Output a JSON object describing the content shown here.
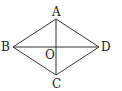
{
  "diagram": {
    "type": "rhombus",
    "stroke_color": "#333333",
    "points": {
      "A": {
        "label": "A",
        "x": 56,
        "y": 19
      },
      "B": {
        "label": "B",
        "x": 13,
        "y": 47
      },
      "C": {
        "label": "C",
        "x": 56,
        "y": 75
      },
      "D": {
        "label": "D",
        "x": 99,
        "y": 47
      },
      "O": {
        "label": "O",
        "x": 56,
        "y": 47
      }
    },
    "edges": [
      "AB",
      "BC",
      "CD",
      "DA"
    ],
    "diagonals": [
      "AC",
      "BD"
    ]
  }
}
